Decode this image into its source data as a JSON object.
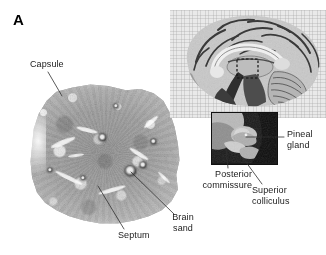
{
  "figure": {
    "panel_letter": "A",
    "background_color": "#ffffff",
    "text_color": "#1b1b1b"
  },
  "labels": {
    "capsule": "Capsule",
    "septum": "Septum",
    "brain_sand_line1": "Brain",
    "brain_sand_line2": "sand",
    "pineal_gland_line1": "Pineal",
    "pineal_gland_line2": "gland",
    "posterior_commissure_line1": "Posterior",
    "posterior_commissure_line2": "commissure",
    "superior_colliculus_line1": "Superior",
    "superior_colliculus_line2": "colliculus"
  },
  "panels": {
    "histology": {
      "name": "pineal-gland-histology-section",
      "description": "low-power micrograph of pineal gland parenchyma"
    },
    "brain_inset": {
      "name": "midsagittal-brain-section",
      "description": "midsagittal hemisphere with dashed locator box over pineal region"
    },
    "pineal_inset": {
      "name": "pineal-region-closeup",
      "description": "magnified view of pineal gland, posterior commissure and superior colliculus"
    }
  }
}
